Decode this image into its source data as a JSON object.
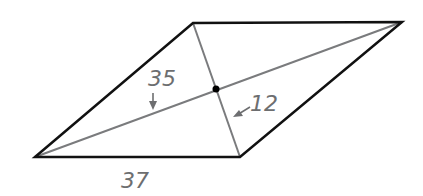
{
  "figure": {
    "shape": "parallelogram (rhombus) with diagonals",
    "labels": {
      "diagonal_half_long": "35",
      "diagonal_half_short": "12",
      "side": "37"
    },
    "colors": {
      "outline": "#111111",
      "diagonal": "#7a7b7d",
      "label": "#6d6e70",
      "center_point": "#000000"
    }
  }
}
